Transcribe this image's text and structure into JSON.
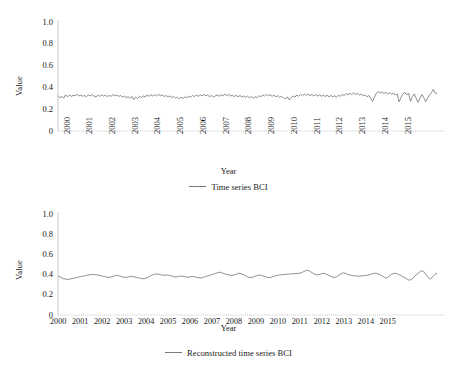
{
  "figure": {
    "background": "#ffffff",
    "line_color": "#7a7a7a",
    "axis_color": "#bfbfbf",
    "text_color": "#1a1a1a"
  },
  "panels": {
    "top": {
      "ylabel": "Value",
      "xlabel": "Year",
      "legend_label": "Time series  BCI",
      "yticks": [
        "1.0",
        "0.8",
        "0.6",
        "0.4",
        "0.2",
        "0"
      ],
      "xticks": [
        "2000",
        "2001",
        "2002",
        "2003",
        "2004",
        "2005",
        "2006",
        "2007",
        "2008",
        "2009",
        "2010",
        "2011",
        "2012",
        "2013",
        "2014",
        "2015"
      ]
    },
    "bottom": {
      "ylabel": "Value",
      "xlabel": "Year",
      "legend_label": "Reconstructed time series  BCI",
      "yticks": [
        "1.0",
        "0.8",
        "0.6",
        "0.4",
        "0.2",
        "0"
      ],
      "xticks": [
        "2000",
        "2001",
        "2002",
        "2003",
        "2004",
        "2005",
        "2006",
        "2007",
        "2008",
        "2009",
        "2010",
        "2011",
        "2012",
        "2013",
        "2014",
        "2015"
      ]
    }
  },
  "chart_data": [
    {
      "type": "line",
      "title": "",
      "xlabel": "Year",
      "ylabel": "Value",
      "ylim": [
        0,
        1.0
      ],
      "yticks": [
        0,
        0.2,
        0.4,
        0.6,
        0.8,
        1.0
      ],
      "grid": false,
      "legend": [
        "Time series  BCI"
      ],
      "legend_position": "bottom-center",
      "x_start": 2000.0,
      "x_step": 0.0833333,
      "x_tick_labels": [
        "2000",
        "2001",
        "2002",
        "2003",
        "2004",
        "2005",
        "2006",
        "2007",
        "2008",
        "2009",
        "2010",
        "2011",
        "2012",
        "2013",
        "2014",
        "2015"
      ],
      "series": [
        {
          "name": "Time series  BCI",
          "color": "#7a7a7a",
          "values": [
            0.325,
            0.305,
            0.318,
            0.3,
            0.332,
            0.312,
            0.33,
            0.318,
            0.328,
            0.322,
            0.338,
            0.32,
            0.33,
            0.318,
            0.326,
            0.314,
            0.33,
            0.322,
            0.334,
            0.32,
            0.312,
            0.328,
            0.318,
            0.332,
            0.32,
            0.33,
            0.316,
            0.326,
            0.318,
            0.334,
            0.322,
            0.33,
            0.318,
            0.326,
            0.31,
            0.32,
            0.306,
            0.316,
            0.3,
            0.318,
            0.288,
            0.312,
            0.298,
            0.318,
            0.306,
            0.322,
            0.312,
            0.33,
            0.318,
            0.332,
            0.32,
            0.334,
            0.322,
            0.336,
            0.324,
            0.33,
            0.316,
            0.326,
            0.312,
            0.322,
            0.306,
            0.318,
            0.3,
            0.312,
            0.296,
            0.31,
            0.298,
            0.314,
            0.304,
            0.32,
            0.31,
            0.326,
            0.316,
            0.33,
            0.318,
            0.332,
            0.322,
            0.336,
            0.324,
            0.33,
            0.314,
            0.326,
            0.312,
            0.322,
            0.33,
            0.318,
            0.334,
            0.322,
            0.338,
            0.326,
            0.334,
            0.32,
            0.33,
            0.316,
            0.328,
            0.314,
            0.326,
            0.312,
            0.322,
            0.308,
            0.32,
            0.304,
            0.318,
            0.3,
            0.316,
            0.306,
            0.324,
            0.314,
            0.33,
            0.32,
            0.336,
            0.324,
            0.332,
            0.318,
            0.328,
            0.314,
            0.324,
            0.308,
            0.32,
            0.302,
            0.296,
            0.312,
            0.286,
            0.306,
            0.322,
            0.31,
            0.33,
            0.318,
            0.336,
            0.324,
            0.34,
            0.328,
            0.338,
            0.324,
            0.336,
            0.322,
            0.334,
            0.32,
            0.332,
            0.318,
            0.33,
            0.316,
            0.328,
            0.314,
            0.326,
            0.312,
            0.324,
            0.31,
            0.328,
            0.318,
            0.336,
            0.324,
            0.344,
            0.33,
            0.348,
            0.334,
            0.35,
            0.336,
            0.346,
            0.33,
            0.34,
            0.322,
            0.332,
            0.314,
            0.326,
            0.3,
            0.272,
            0.312,
            0.346,
            0.362,
            0.348,
            0.36,
            0.344,
            0.356,
            0.34,
            0.352,
            0.336,
            0.348,
            0.33,
            0.34,
            0.268,
            0.308,
            0.34,
            0.356,
            0.33,
            0.348,
            0.272,
            0.314,
            0.34,
            0.3,
            0.262,
            0.3,
            0.336,
            0.308,
            0.268,
            0.302,
            0.33,
            0.35,
            0.382,
            0.348,
            0.344
          ]
        }
      ]
    },
    {
      "type": "line",
      "title": "",
      "xlabel": "Year",
      "ylabel": "Value",
      "ylim": [
        0,
        1.0
      ],
      "yticks": [
        0,
        0.2,
        0.4,
        0.6,
        0.8,
        1.0
      ],
      "grid": false,
      "legend": [
        "Reconstructed time series  BCI"
      ],
      "legend_position": "bottom-center",
      "x_start": 2000.0,
      "x_step": 0.0833333,
      "x_tick_labels": [
        "2000",
        "2001",
        "2002",
        "2003",
        "2004",
        "2005",
        "2006",
        "2007",
        "2008",
        "2009",
        "2010",
        "2011",
        "2012",
        "2013",
        "2014",
        "2015"
      ],
      "series": [
        {
          "name": "Reconstructed time series  BCI",
          "color": "#7a7a7a",
          "values": [
            0.386,
            0.378,
            0.368,
            0.36,
            0.356,
            0.352,
            0.354,
            0.358,
            0.362,
            0.366,
            0.37,
            0.374,
            0.378,
            0.382,
            0.386,
            0.39,
            0.394,
            0.398,
            0.4,
            0.402,
            0.4,
            0.398,
            0.394,
            0.39,
            0.386,
            0.382,
            0.378,
            0.374,
            0.372,
            0.376,
            0.382,
            0.388,
            0.394,
            0.39,
            0.384,
            0.378,
            0.374,
            0.372,
            0.376,
            0.38,
            0.384,
            0.38,
            0.376,
            0.372,
            0.368,
            0.364,
            0.36,
            0.358,
            0.364,
            0.372,
            0.382,
            0.392,
            0.4,
            0.404,
            0.406,
            0.404,
            0.4,
            0.396,
            0.392,
            0.394,
            0.396,
            0.392,
            0.386,
            0.38,
            0.376,
            0.378,
            0.382,
            0.386,
            0.384,
            0.38,
            0.376,
            0.374,
            0.378,
            0.382,
            0.38,
            0.376,
            0.372,
            0.368,
            0.366,
            0.37,
            0.376,
            0.382,
            0.388,
            0.394,
            0.4,
            0.406,
            0.412,
            0.418,
            0.424,
            0.42,
            0.414,
            0.408,
            0.402,
            0.398,
            0.394,
            0.392,
            0.396,
            0.402,
            0.408,
            0.414,
            0.41,
            0.402,
            0.392,
            0.382,
            0.374,
            0.37,
            0.374,
            0.38,
            0.386,
            0.392,
            0.396,
            0.392,
            0.386,
            0.38,
            0.374,
            0.37,
            0.372,
            0.378,
            0.384,
            0.39,
            0.394,
            0.396,
            0.398,
            0.4,
            0.402,
            0.404,
            0.406,
            0.406,
            0.408,
            0.41,
            0.41,
            0.412,
            0.414,
            0.42,
            0.428,
            0.436,
            0.444,
            0.438,
            0.428,
            0.416,
            0.406,
            0.4,
            0.398,
            0.402,
            0.408,
            0.414,
            0.408,
            0.4,
            0.392,
            0.384,
            0.376,
            0.37,
            0.378,
            0.39,
            0.402,
            0.412,
            0.418,
            0.412,
            0.404,
            0.398,
            0.394,
            0.39,
            0.388,
            0.386,
            0.384,
            0.386,
            0.388,
            0.39,
            0.392,
            0.394,
            0.398,
            0.404,
            0.41,
            0.414,
            0.412,
            0.406,
            0.398,
            0.388,
            0.376,
            0.364,
            0.372,
            0.386,
            0.4,
            0.41,
            0.414,
            0.41,
            0.402,
            0.392,
            0.382,
            0.372,
            0.362,
            0.352,
            0.344,
            0.352,
            0.368,
            0.386,
            0.404,
            0.42,
            0.432,
            0.438,
            0.424,
            0.4,
            0.376,
            0.358,
            0.368,
            0.386,
            0.404,
            0.414
          ]
        }
      ]
    }
  ]
}
